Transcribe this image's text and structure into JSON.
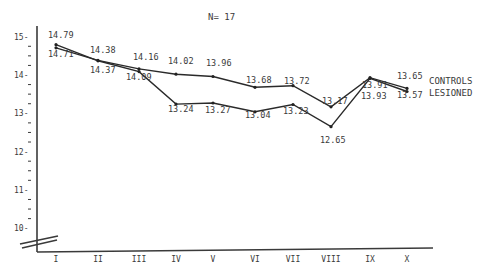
{
  "chart_data": {
    "type": "line",
    "title": "",
    "subtitle": "N= 17",
    "xlabel": "",
    "ylabel": "",
    "categories": [
      "I",
      "II",
      "III",
      "IV",
      "V",
      "VI",
      "VII",
      "VIII",
      "IX",
      "X"
    ],
    "series": [
      {
        "name": "CONTROLS",
        "values": [
          14.71,
          14.38,
          14.16,
          14.02,
          13.96,
          13.68,
          13.72,
          13.17,
          13.93,
          13.65
        ]
      },
      {
        "name": "LESIONED",
        "values": [
          14.79,
          14.37,
          14.09,
          13.24,
          13.27,
          13.04,
          13.23,
          12.65,
          13.91,
          13.57
        ]
      }
    ],
    "yticks": [
      10,
      11,
      12,
      13,
      14,
      15
    ],
    "ylim": [
      9.5,
      15.3
    ],
    "y_axis_break": true,
    "grid": false,
    "legend_position": "right, inline at series ends",
    "data_labels": {
      "controls": [
        "14.71",
        "14.38",
        "14.16",
        "14.02",
        "13.96",
        "13.68",
        "13.72",
        "13.17",
        "13.93",
        "13.65"
      ],
      "lesioned": [
        "14.79",
        "14.37",
        "14.09",
        "13.24",
        "13.27",
        "13.04",
        "13.23",
        "12.65",
        "13.91",
        "13.57"
      ]
    }
  },
  "header": {
    "n_label": "N= 17"
  },
  "legend": {
    "controls": "CONTROLS",
    "lesioned": "LESIONED"
  }
}
